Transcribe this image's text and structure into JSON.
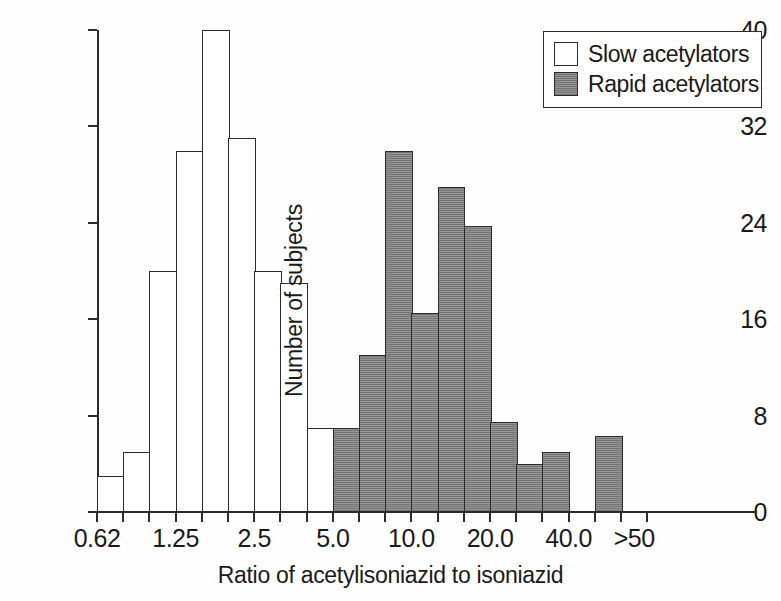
{
  "chart_data": {
    "type": "bar",
    "title": "",
    "xlabel": "Ratio of acetylisoniazid to isoniazid",
    "ylabel": "Number of subjects",
    "ylim": [
      0,
      40
    ],
    "yticks": [
      0,
      8,
      16,
      24,
      32,
      40
    ],
    "ytick_labels": [
      "0",
      "8",
      "16",
      "24",
      "32",
      "40"
    ],
    "xtick_labels": [
      "0.62",
      "1.25",
      "2.5",
      "5.0",
      "10.0",
      "20.0",
      "40.0",
      ">50"
    ],
    "grid": false,
    "legend_position": "top-right",
    "note": "Bimodal histogram on a logarithmic ratio axis; bin edges fall on the minor tick marks.",
    "series": [
      {
        "name": "Slow acetylators",
        "color": "#ffffff",
        "edge_color": "#2b2b2b",
        "bins": [
          {
            "index": 1,
            "value": 3
          },
          {
            "index": 2,
            "value": 5
          },
          {
            "index": 3,
            "value": 20
          },
          {
            "index": 4,
            "value": 30
          },
          {
            "index": 5,
            "value": 40
          },
          {
            "index": 6,
            "value": 31
          },
          {
            "index": 7,
            "value": 20
          },
          {
            "index": 8,
            "value": 19
          },
          {
            "index": 9,
            "value": 7
          }
        ]
      },
      {
        "name": "Rapid acetylators",
        "color": "#8a8a8a",
        "edge_color": "#2b2b2b",
        "bins": [
          {
            "index": 10,
            "value": 7
          },
          {
            "index": 11,
            "value": 13
          },
          {
            "index": 12,
            "value": 30
          },
          {
            "index": 13,
            "value": 16.5
          },
          {
            "index": 14,
            "value": 27
          },
          {
            "index": 15,
            "value": 23.7
          },
          {
            "index": 16,
            "value": 7.5
          },
          {
            "index": 17,
            "value": 4
          },
          {
            "index": 18,
            "value": 5
          },
          {
            "index": 20,
            "value": 6.3
          }
        ]
      }
    ]
  },
  "legend": {
    "items": [
      {
        "label": "Slow acetylators",
        "style": "slow"
      },
      {
        "label": "Rapid acetylators",
        "style": "rapid"
      }
    ]
  }
}
